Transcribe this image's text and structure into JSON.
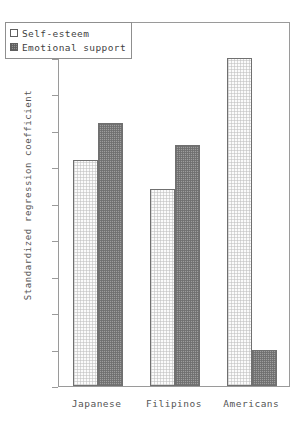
{
  "chart_data": {
    "type": "bar",
    "title": "",
    "xlabel": "",
    "ylabel": "Standardized regression coefficient",
    "categories": [
      "Japanese",
      "Filipinos",
      "Americans"
    ],
    "series": [
      {
        "name": "Self-esteem",
        "values": [
          0.31,
          0.27,
          0.45
        ],
        "fill": "light"
      },
      {
        "name": "Emotional support",
        "values": [
          0.36,
          0.33,
          0.05
        ],
        "fill": "dark"
      }
    ],
    "ylim": [
      0,
      0.5
    ],
    "ytick_labels": [
      "0.5",
      "0.45",
      "0.4",
      "0.35",
      "0.3",
      "0.25",
      "0.2",
      "0.15",
      "0.1",
      "0.05",
      "0"
    ],
    "ytick_values": [
      0.5,
      0.45,
      0.4,
      0.35,
      0.3,
      0.25,
      0.2,
      0.15,
      0.1,
      0.05,
      0
    ],
    "grid": false,
    "legend_position": "top-left",
    "colors": {
      "light_fill": "#fbfbfb",
      "dark_fill": "#9d9d9d",
      "bar_outline": "#707070",
      "axis": "#9a9a9a",
      "text": "#555555",
      "background": "#ffffff"
    }
  }
}
